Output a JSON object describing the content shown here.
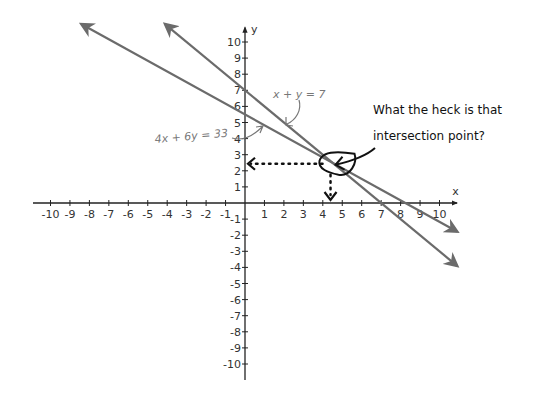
{
  "chart_data": {
    "type": "line",
    "title": "",
    "xlabel": "x",
    "ylabel": "y",
    "xlim": [
      -10,
      10
    ],
    "ylim": [
      -10,
      10
    ],
    "grid": false,
    "x_ticks": [
      -10,
      -9,
      -8,
      -7,
      -6,
      -5,
      -4,
      -3,
      -2,
      -1,
      1,
      2,
      3,
      4,
      5,
      6,
      7,
      8,
      9,
      10
    ],
    "y_ticks": [
      10,
      9,
      8,
      7,
      6,
      5,
      4,
      3,
      2,
      1,
      -1,
      -2,
      -3,
      -4,
      -5,
      -6,
      -7,
      -8,
      -9,
      -10
    ],
    "series": [
      {
        "name": "4x + 6y = 33",
        "label": "4x + 6y = 33",
        "a": 4,
        "b": 6,
        "c": 33,
        "y_intercept": 5.5,
        "x_intercept": 8.25,
        "x_range": [
          -8.4,
          10.9
        ],
        "color": "#6b6b6b"
      },
      {
        "name": "x + y = 7",
        "label": "x + y = 7",
        "a": 1,
        "b": 1,
        "c": 7,
        "y_intercept": 7,
        "x_intercept": 7,
        "x_range": [
          -4.1,
          10.9
        ],
        "color": "#6b6b6b"
      }
    ],
    "intersection": {
      "x": 4.5,
      "y": 2.5
    },
    "annotations": [
      {
        "text": "What the heck is that",
        "target": "intersection"
      },
      {
        "text": "intersection point?",
        "target": "intersection"
      }
    ]
  }
}
